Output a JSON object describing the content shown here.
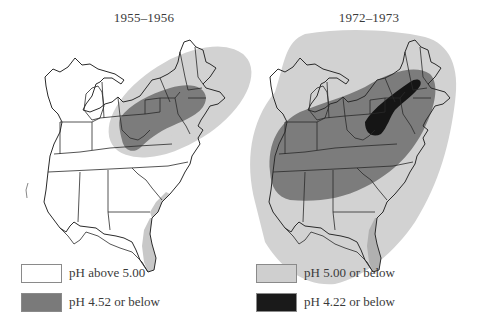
{
  "maps": [
    {
      "title": "1955–1956",
      "period": "left"
    },
    {
      "title": "1972–1973",
      "period": "right"
    }
  ],
  "legend": {
    "items": [
      {
        "label": "pH above 5.00",
        "color": "#ffffff"
      },
      {
        "label": "pH 4.52 or below",
        "color": "#7a7a7a"
      },
      {
        "label": "pH 5.00 or below",
        "color": "#cfcfcf"
      },
      {
        "label": "pH 4.22 or below",
        "color": "#1a1a1a"
      }
    ]
  },
  "colors": {
    "background": "#ffffff",
    "state_outline": "#2a2a2a",
    "above_5": "#ffffff",
    "below_5": "#d2d2d2",
    "below_4_52": "#7c7c7c",
    "below_4_22": "#151515",
    "coast_strip": "#bdbdbd"
  }
}
